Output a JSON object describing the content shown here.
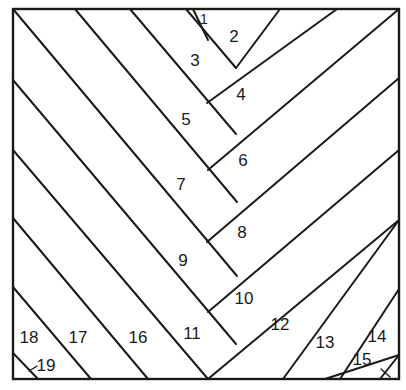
{
  "diagram": {
    "frame": {
      "x": 13,
      "y": 9,
      "width": 386,
      "height": 370
    },
    "colors": {
      "line": "#1a1a1a",
      "background": "#ffffff"
    },
    "lines": [
      {
        "id": "spine-left-1",
        "x1": 208,
        "y1": 40,
        "x2": 236,
        "y2": 68
      },
      {
        "id": "spine-right-1",
        "x1": 193,
        "y1": 9,
        "x2": 208,
        "y2": 40
      },
      {
        "id": "top-2-right",
        "x1": 208,
        "y1": 40,
        "x2": 226,
        "y2": 9
      },
      {
        "id": "L-a",
        "x1": 186,
        "y1": 9,
        "x2": 236,
        "y2": 68
      },
      {
        "id": "R-a",
        "x1": 236,
        "y1": 68,
        "x2": 280,
        "y2": 9
      },
      {
        "id": "L-b",
        "x1": 130,
        "y1": 9,
        "x2": 236,
        "y2": 134
      },
      {
        "id": "R-b",
        "x1": 207,
        "y1": 103,
        "x2": 337,
        "y2": 9
      },
      {
        "id": "L-c",
        "x1": 75,
        "y1": 9,
        "x2": 237,
        "y2": 202
      },
      {
        "id": "R-c",
        "x1": 208,
        "y1": 170,
        "x2": 399,
        "y2": 9
      },
      {
        "id": "L-d",
        "x1": 13,
        "y1": 9,
        "x2": 237,
        "y2": 276
      },
      {
        "id": "R-d",
        "x1": 207,
        "y1": 242,
        "x2": 399,
        "y2": 78
      },
      {
        "id": "L-e",
        "x1": 13,
        "y1": 80,
        "x2": 236,
        "y2": 344
      },
      {
        "id": "R-e",
        "x1": 208,
        "y1": 312,
        "x2": 399,
        "y2": 150
      },
      {
        "id": "L-f",
        "x1": 13,
        "y1": 150,
        "x2": 208,
        "y2": 379
      },
      {
        "id": "R-f",
        "x1": 208,
        "y1": 379,
        "x2": 399,
        "y2": 220
      },
      {
        "id": "L-g",
        "x1": 13,
        "y1": 218,
        "x2": 148,
        "y2": 379
      },
      {
        "id": "R-g",
        "x1": 268,
        "y1": 379,
        "x2": 399,
        "y2": 289
      },
      {
        "id": "L-h",
        "x1": 13,
        "y1": 287,
        "x2": 91,
        "y2": 379
      },
      {
        "id": "R-h",
        "x1": 325,
        "y1": 379,
        "x2": 399,
        "y2": 355
      },
      {
        "id": "L-i",
        "x1": 13,
        "y1": 353,
        "x2": 38,
        "y2": 379
      },
      {
        "id": "R-i",
        "x1": 380,
        "y1": 379,
        "x2": 399,
        "y2": 355
      },
      {
        "id": "R-g2",
        "x1": 340,
        "y1": 379,
        "x2": 399,
        "y2": 289
      },
      {
        "id": "R-f2",
        "x1": 283,
        "y1": 379,
        "x2": 399,
        "y2": 220
      }
    ],
    "labels": [
      {
        "text": "1",
        "x": 204,
        "y": 24,
        "small": true
      },
      {
        "text": "2",
        "x": 234,
        "y": 42
      },
      {
        "text": "3",
        "x": 195,
        "y": 66
      },
      {
        "text": "4",
        "x": 241,
        "y": 100
      },
      {
        "text": "5",
        "x": 186,
        "y": 125
      },
      {
        "text": "6",
        "x": 243,
        "y": 166
      },
      {
        "text": "7",
        "x": 181,
        "y": 190
      },
      {
        "text": "8",
        "x": 242,
        "y": 238
      },
      {
        "text": "9",
        "x": 183,
        "y": 266
      },
      {
        "text": "10",
        "x": 244,
        "y": 304
      },
      {
        "text": "11",
        "x": 192,
        "y": 339
      },
      {
        "text": "12",
        "x": 280,
        "y": 330
      },
      {
        "text": "13",
        "x": 325,
        "y": 348
      },
      {
        "text": "14",
        "x": 377,
        "y": 342
      },
      {
        "text": "15",
        "x": 362,
        "y": 365
      },
      {
        "text": "16",
        "x": 138,
        "y": 343
      },
      {
        "text": "17",
        "x": 78,
        "y": 343
      },
      {
        "text": "18",
        "x": 29,
        "y": 343
      },
      {
        "text": "19",
        "x": 46,
        "y": 371
      }
    ],
    "ticks": [
      {
        "id": "tick-19",
        "x1": 29,
        "y1": 371,
        "x2": 37,
        "y2": 366
      },
      {
        "id": "tick-15",
        "x1": 381,
        "y1": 369,
        "x2": 390,
        "y2": 377
      }
    ]
  }
}
